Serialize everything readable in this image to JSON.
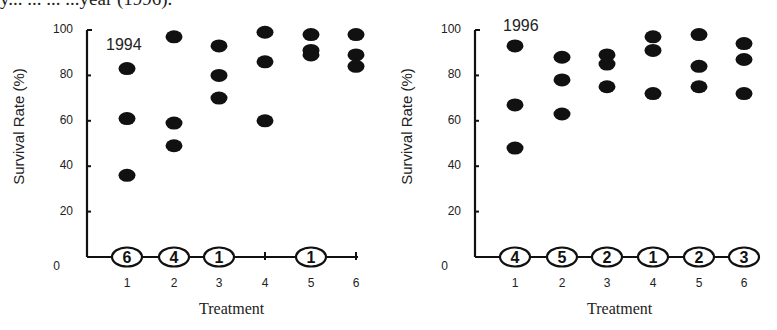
{
  "caption_fragment": "y... ... ... ...year (1996).",
  "chart_data": [
    {
      "type": "scatter",
      "title": "1994",
      "xlabel": "Treatment",
      "ylabel": "Survival Rate (%)",
      "ylim": [
        0,
        100
      ],
      "yticks": [
        "0",
        "20",
        "40",
        "60",
        "80",
        "100"
      ],
      "xticks": [
        "1",
        "2",
        "3",
        "4",
        "5",
        "6"
      ],
      "grid": false,
      "points": [
        {
          "x": 1,
          "y": [
            83,
            61,
            36
          ]
        },
        {
          "x": 2,
          "y": [
            97,
            59,
            49
          ]
        },
        {
          "x": 3,
          "y": [
            93,
            80,
            70
          ]
        },
        {
          "x": 4,
          "y": [
            99,
            86,
            60
          ]
        },
        {
          "x": 5,
          "y": [
            98,
            91,
            89
          ]
        },
        {
          "x": 6,
          "y": [
            98,
            89,
            84
          ]
        }
      ],
      "zero_counts": [
        {
          "x": 1,
          "label": "6"
        },
        {
          "x": 2,
          "label": "4"
        },
        {
          "x": 3,
          "label": "1"
        },
        {
          "x": 4,
          "label": null
        },
        {
          "x": 5,
          "label": "1"
        },
        {
          "x": 6,
          "label": null
        }
      ]
    },
    {
      "type": "scatter",
      "title": "1996",
      "xlabel": "Treatment",
      "ylabel": "Survival Rate (%)",
      "ylim": [
        0,
        100
      ],
      "yticks": [
        "0",
        "20",
        "40",
        "60",
        "80",
        "100"
      ],
      "xticks": [
        "1",
        "2",
        "3",
        "4",
        "5",
        "6"
      ],
      "grid": false,
      "points": [
        {
          "x": 1,
          "y": [
            93,
            67,
            48
          ]
        },
        {
          "x": 2,
          "y": [
            88,
            78,
            63
          ]
        },
        {
          "x": 3,
          "y": [
            89,
            85,
            75
          ]
        },
        {
          "x": 4,
          "y": [
            97,
            91,
            72
          ]
        },
        {
          "x": 5,
          "y": [
            98,
            84,
            75
          ]
        },
        {
          "x": 6,
          "y": [
            94,
            87,
            72
          ]
        }
      ],
      "zero_counts": [
        {
          "x": 1,
          "label": "4"
        },
        {
          "x": 2,
          "label": "5"
        },
        {
          "x": 3,
          "label": "2"
        },
        {
          "x": 4,
          "label": "1"
        },
        {
          "x": 5,
          "label": "2"
        },
        {
          "x": 6,
          "label": "3"
        }
      ]
    }
  ]
}
